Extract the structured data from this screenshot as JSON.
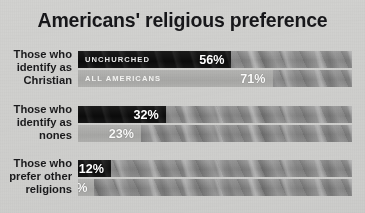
{
  "title": "Americans' religious preference",
  "chart_data": {
    "type": "bar",
    "title": "Americans' religious preference",
    "xlabel": "",
    "ylabel": "",
    "xlim": [
      0,
      100
    ],
    "unit": "%",
    "grid": false,
    "orientation": "horizontal",
    "legend_position": "in-bar",
    "series": [
      {
        "name": "UNCHURCHED",
        "color": "#0f0f0f",
        "values": [
          56,
          32,
          12
        ]
      },
      {
        "name": "ALL AMERICANS",
        "color": "#aeaeac",
        "values": [
          71,
          23,
          6
        ]
      }
    ],
    "categories": [
      "Those who identify as Christian",
      "Those who identify as nones",
      "Those who prefer other religions"
    ],
    "groups": [
      {
        "label": "Those who\nidentify as\nChristian",
        "label_lines": [
          "Those who",
          "identify as",
          "Christian"
        ],
        "bars": [
          {
            "series": "UNCHURCHED",
            "show_series_name": true,
            "value": 56,
            "value_label": "56%"
          },
          {
            "series": "ALL AMERICANS",
            "show_series_name": true,
            "value": 71,
            "value_label": "71%"
          }
        ]
      },
      {
        "label": "Those who\nidentify as\nnones",
        "label_lines": [
          "Those who",
          "identify as",
          "nones"
        ],
        "bars": [
          {
            "series": "UNCHURCHED",
            "show_series_name": false,
            "value": 32,
            "value_label": "32%"
          },
          {
            "series": "ALL AMERICANS",
            "show_series_name": false,
            "value": 23,
            "value_label": "23%"
          }
        ]
      },
      {
        "label": "Those who\nprefer other\nreligions",
        "label_lines": [
          "Those who",
          "prefer other",
          "religions"
        ],
        "bars": [
          {
            "series": "UNCHURCHED",
            "show_series_name": false,
            "value": 12,
            "value_label": "12%"
          },
          {
            "series": "ALL AMERICANS",
            "show_series_name": false,
            "value": 6,
            "value_label": "6%"
          }
        ]
      }
    ]
  },
  "colors": {
    "background": "#d2d2d0",
    "track": "#8d8d8d",
    "dark_bar": "#0f0f0f",
    "light_bar": "#aeaeac",
    "title_text": "#17171a",
    "label_text": "#1a1a1c",
    "value_text": "#ffffff"
  }
}
